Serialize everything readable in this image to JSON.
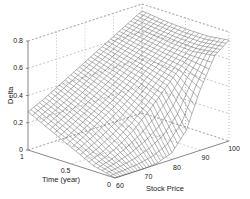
{
  "chart_data": {
    "type": "surface",
    "title": "",
    "xlabel": "Stock Price",
    "ylabel": "Time (year)",
    "zlabel": "Delta",
    "xlim": [
      60,
      100
    ],
    "ylim": [
      0,
      1
    ],
    "zlim": [
      0,
      0.8
    ],
    "x_ticks": [
      "60",
      "70",
      "80",
      "90",
      "100"
    ],
    "y_ticks": [
      "0",
      "0.5",
      "1"
    ],
    "z_ticks": [
      "0",
      "0.2",
      "0.4",
      "0.6",
      "0.8"
    ],
    "grid": true,
    "surface": {
      "description": "Call option delta vs stock price and time to maturity; rises from ~0.3 at price 60 (time 1) to ~0.8 at price 100; near time 0 delta is ~0 below ~85 then rises steeply",
      "strike_approx": 90,
      "x_samples": [
        60,
        65,
        70,
        75,
        80,
        85,
        90,
        95,
        100
      ],
      "y_samples": [
        0,
        0.25,
        0.5,
        0.75,
        1
      ],
      "z": [
        [
          0.0,
          0.0,
          0.0,
          0.01,
          0.05,
          0.18,
          0.45,
          0.66,
          0.74
        ],
        [
          0.04,
          0.08,
          0.14,
          0.22,
          0.32,
          0.43,
          0.54,
          0.64,
          0.72
        ],
        [
          0.12,
          0.18,
          0.25,
          0.32,
          0.4,
          0.49,
          0.57,
          0.65,
          0.72
        ],
        [
          0.2,
          0.26,
          0.32,
          0.39,
          0.46,
          0.53,
          0.6,
          0.67,
          0.73
        ],
        [
          0.28,
          0.33,
          0.39,
          0.45,
          0.51,
          0.57,
          0.63,
          0.69,
          0.75
        ]
      ]
    }
  }
}
